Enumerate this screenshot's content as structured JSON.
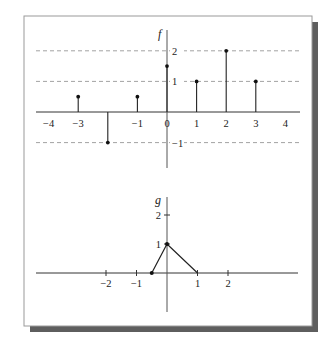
{
  "frame": {
    "border_color": "#9a9a9a",
    "shadow_color": "#5e5e5e",
    "background": "#ffffff"
  },
  "chart_data": [
    {
      "type": "stem",
      "title": "",
      "ylabel": "f",
      "xlabel": "",
      "x_ticks": [
        -4,
        -3,
        -1,
        0,
        1,
        2,
        3,
        4
      ],
      "x_tick_labels": [
        "−4",
        "−3",
        "−1",
        "0",
        "1",
        "2",
        "3",
        "4"
      ],
      "y_ticks": [
        2,
        1,
        -1
      ],
      "y_tick_labels": [
        "2",
        "1",
        "−1"
      ],
      "gridlines": [
        2,
        1,
        -1
      ],
      "grid_style": "dashed horizontal",
      "xlim": [
        -4.5,
        4.5
      ],
      "ylim": [
        -1.8,
        2.6
      ],
      "points": [
        {
          "x": -3,
          "y": 0.5
        },
        {
          "x": -2,
          "y": -1
        },
        {
          "x": -1,
          "y": 0.5
        },
        {
          "x": 0,
          "y": 1.5
        },
        {
          "x": 1,
          "y": 1
        },
        {
          "x": 2,
          "y": 2
        },
        {
          "x": 3,
          "y": 1
        }
      ]
    },
    {
      "type": "line",
      "title": "",
      "ylabel": "g",
      "xlabel": "",
      "x_ticks": [
        -2,
        -1,
        1,
        2
      ],
      "x_tick_labels": [
        "−2",
        "−1",
        "1",
        "2"
      ],
      "y_ticks": [
        2,
        1
      ],
      "y_tick_labels": [
        "2",
        "1"
      ],
      "grid": false,
      "xlim": [
        -5.1,
        4.3
      ],
      "ylim": [
        -1.2,
        2.8
      ],
      "points": [
        {
          "x": -0.5,
          "y": 0
        },
        {
          "x": 0,
          "y": 1
        },
        {
          "x": 1,
          "y": 0
        }
      ],
      "marked_points": [
        {
          "x": -0.5,
          "y": 0
        },
        {
          "x": 0,
          "y": 1
        }
      ]
    }
  ]
}
